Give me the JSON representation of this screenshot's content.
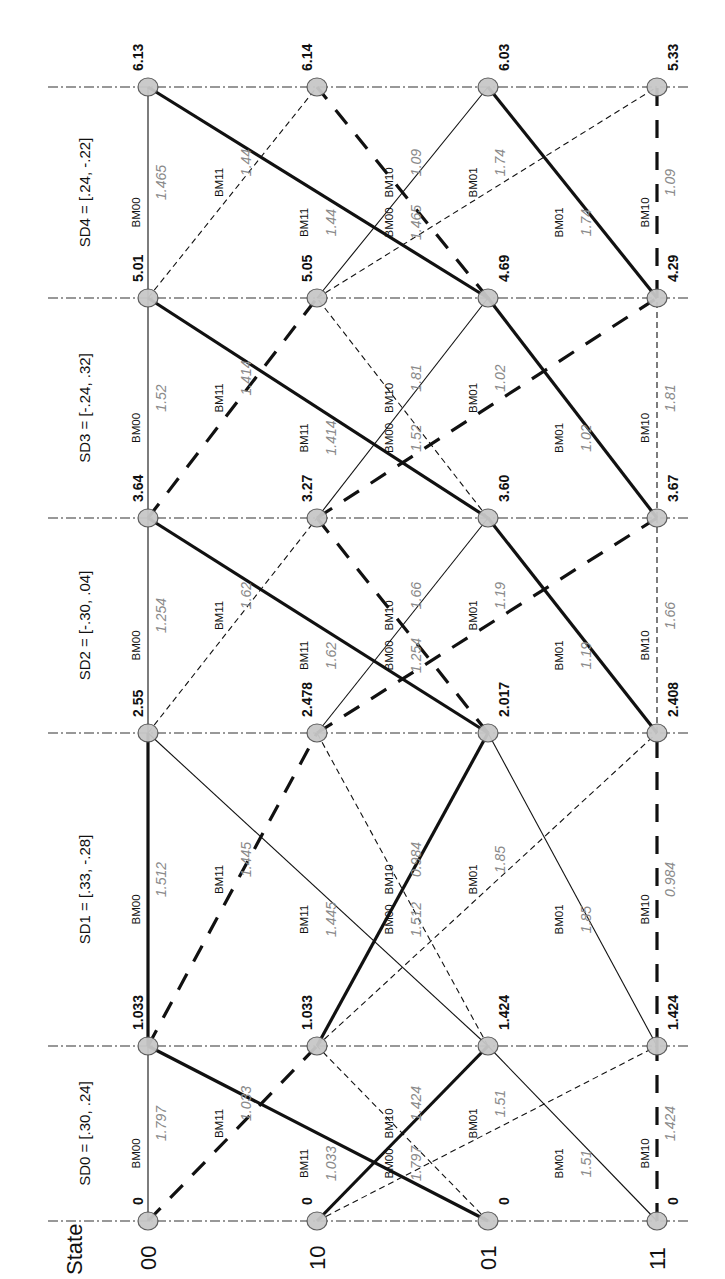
{
  "diagram": {
    "title_header": "State",
    "states": [
      "00",
      "10",
      "01",
      "11"
    ],
    "stages": [
      {
        "label": "SD0 = [.30, .24]"
      },
      {
        "label": "SD1 = [.33, -.28]"
      },
      {
        "label": "SD2 = [-.30, .04]"
      },
      {
        "label": "SD3 = [-.24, .32]"
      },
      {
        "label": "SD4 = [.24, -.22]"
      }
    ],
    "path_metrics": [
      [
        "0",
        "0",
        "0",
        "0"
      ],
      [
        "1.033",
        "1.033",
        "1.424",
        "1.424"
      ],
      [
        "2.55",
        "2.478",
        "2.017",
        "2.408"
      ],
      [
        "3.64",
        "3.27",
        "3.60",
        "3.67"
      ],
      [
        "5.01",
        "5.05",
        "4.69",
        "4.29"
      ],
      [
        "6.13",
        "6.14",
        "6.03",
        "5.33"
      ]
    ],
    "branches": [
      [
        {
          "from": "00",
          "to": "00",
          "bm": "BM00",
          "w": "1.797",
          "style": "thin"
        },
        {
          "from": "00",
          "to": "10",
          "bm": "BM11",
          "w": "1.033",
          "style": "heavydash"
        },
        {
          "from": "01",
          "to": "00",
          "bm": "BM11",
          "w": "1.033",
          "style": "thick"
        },
        {
          "from": "01",
          "to": "10",
          "bm": "BM00",
          "w": "1.797",
          "style": "dash"
        },
        {
          "from": "10",
          "to": "01",
          "bm": "BM10",
          "w": "1.424",
          "style": "thick"
        },
        {
          "from": "10",
          "to": "11",
          "bm": "BM01",
          "w": "1.51",
          "style": "dash"
        },
        {
          "from": "11",
          "to": "01",
          "bm": "BM01",
          "w": "1.51",
          "style": "thin"
        },
        {
          "from": "11",
          "to": "11",
          "bm": "BM10",
          "w": "1.424",
          "style": "heavydash"
        }
      ],
      [
        {
          "from": "00",
          "to": "00",
          "bm": "BM00",
          "w": "1.512",
          "style": "thick"
        },
        {
          "from": "00",
          "to": "10",
          "bm": "BM11",
          "w": "1.445",
          "style": "heavydash"
        },
        {
          "from": "01",
          "to": "00",
          "bm": "BM11",
          "w": "1.445",
          "style": "thin"
        },
        {
          "from": "01",
          "to": "10",
          "bm": "BM00",
          "w": "1.512",
          "style": "dash"
        },
        {
          "from": "10",
          "to": "01",
          "bm": "BM10",
          "w": "0.984",
          "style": "thick"
        },
        {
          "from": "10",
          "to": "11",
          "bm": "BM01",
          "w": "1.85",
          "style": "dash"
        },
        {
          "from": "11",
          "to": "01",
          "bm": "BM01",
          "w": "1.85",
          "style": "thin"
        },
        {
          "from": "11",
          "to": "11",
          "bm": "BM10",
          "w": "0.984",
          "style": "heavydash"
        }
      ],
      [
        {
          "from": "00",
          "to": "00",
          "bm": "BM00",
          "w": "1.254",
          "style": "thin"
        },
        {
          "from": "00",
          "to": "10",
          "bm": "BM11",
          "w": "1.62",
          "style": "dash"
        },
        {
          "from": "01",
          "to": "00",
          "bm": "BM11",
          "w": "1.62",
          "style": "thick"
        },
        {
          "from": "01",
          "to": "10",
          "bm": "BM00",
          "w": "1.254",
          "style": "heavydash"
        },
        {
          "from": "10",
          "to": "01",
          "bm": "BM10",
          "w": "1.66",
          "style": "thin"
        },
        {
          "from": "10",
          "to": "11",
          "bm": "BM01",
          "w": "1.19",
          "style": "heavydash"
        },
        {
          "from": "11",
          "to": "01",
          "bm": "BM01",
          "w": "1.19",
          "style": "thick"
        },
        {
          "from": "11",
          "to": "11",
          "bm": "BM10",
          "w": "1.66",
          "style": "dash"
        }
      ],
      [
        {
          "from": "00",
          "to": "00",
          "bm": "BM00",
          "w": "1.52",
          "style": "thin"
        },
        {
          "from": "00",
          "to": "10",
          "bm": "BM11",
          "w": "1.414",
          "style": "heavydash"
        },
        {
          "from": "01",
          "to": "00",
          "bm": "BM11",
          "w": "1.414",
          "style": "thick"
        },
        {
          "from": "01",
          "to": "10",
          "bm": "BM00",
          "w": "1.52",
          "style": "dash"
        },
        {
          "from": "10",
          "to": "01",
          "bm": "BM10",
          "w": "1.81",
          "style": "thin"
        },
        {
          "from": "10",
          "to": "11",
          "bm": "BM01",
          "w": "1.02",
          "style": "heavydash"
        },
        {
          "from": "11",
          "to": "01",
          "bm": "BM01",
          "w": "1.02",
          "style": "thick"
        },
        {
          "from": "11",
          "to": "11",
          "bm": "BM10",
          "w": "1.81",
          "style": "dash"
        }
      ],
      [
        {
          "from": "00",
          "to": "00",
          "bm": "BM00",
          "w": "1.465",
          "style": "thin"
        },
        {
          "from": "00",
          "to": "10",
          "bm": "BM11",
          "w": "1.44",
          "style": "dash"
        },
        {
          "from": "01",
          "to": "00",
          "bm": "BM11",
          "w": "1.44",
          "style": "thick"
        },
        {
          "from": "01",
          "to": "10",
          "bm": "BM00",
          "w": "1.465",
          "style": "heavydash"
        },
        {
          "from": "10",
          "to": "01",
          "bm": "BM10",
          "w": "1.09",
          "style": "thin"
        },
        {
          "from": "10",
          "to": "11",
          "bm": "BM01",
          "w": "1.74",
          "style": "dash"
        },
        {
          "from": "11",
          "to": "01",
          "bm": "BM01",
          "w": "1.74",
          "style": "thick"
        },
        {
          "from": "11",
          "to": "11",
          "bm": "BM10",
          "w": "1.09",
          "style": "heavydash"
        }
      ]
    ],
    "colors": {
      "line": "#111111",
      "node_fill": "#c8c8c8",
      "node_stroke": "#555555",
      "weight_text": "#8a8a8a",
      "grid": "#333333"
    }
  }
}
